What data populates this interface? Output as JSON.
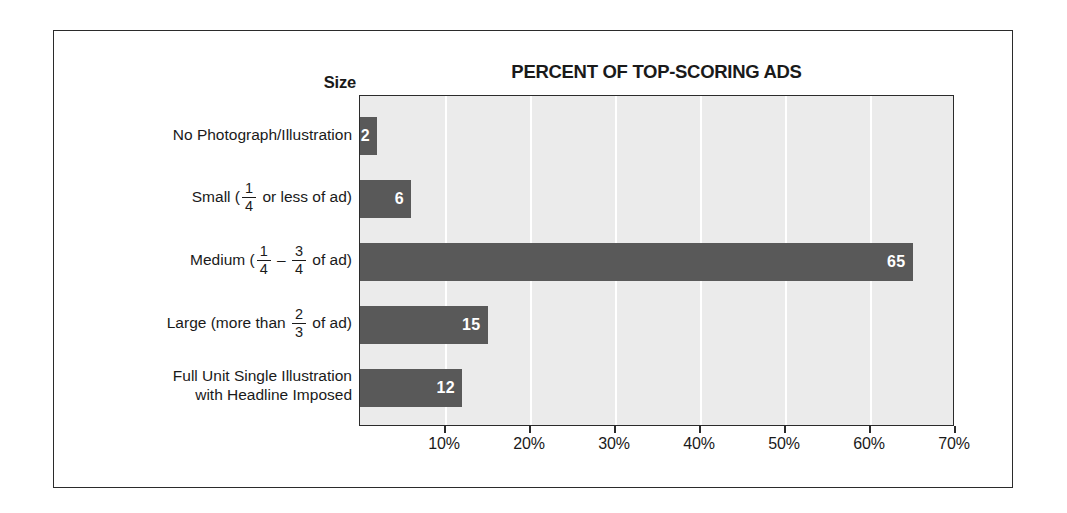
{
  "chart_data": {
    "type": "bar",
    "orientation": "horizontal",
    "title": "PERCENT OF TOP-SCORING ADS",
    "ylabel": "Size",
    "xlabel": "",
    "categories": [
      "No Photograph/Illustration",
      "Small ( 1/4 or less of ad)",
      "Medium ( 1/4 – 3/4 of ad)",
      "Large (more than 2/3 of ad)",
      "Full Unit Single Illustration with Headline Imposed"
    ],
    "values": [
      2,
      6,
      65,
      15,
      12
    ],
    "value_labels": [
      "2",
      "6",
      "65",
      "15",
      "12"
    ],
    "xlim": [
      0,
      70
    ],
    "xticks": [
      10,
      20,
      30,
      40,
      50,
      60,
      70
    ],
    "xtick_labels": [
      "10%",
      "20%",
      "30%",
      "40%",
      "50%",
      "60%",
      "70%"
    ],
    "grid": true,
    "legend": null,
    "bar_color": "#595959",
    "plot_background": "#ebebeb",
    "gridline_color": "#ffffff",
    "text_color": "#1a1a1a",
    "value_label_color": "#ffffff"
  },
  "categories_rich": [
    {
      "id": "no-photograph",
      "lines": [
        {
          "parts": [
            {
              "type": "text",
              "text": "No Photograph/Illustration"
            }
          ]
        }
      ]
    },
    {
      "id": "small",
      "lines": [
        {
          "parts": [
            {
              "type": "text",
              "text": "Small ("
            },
            {
              "type": "fraction",
              "numerator": "1",
              "denominator": "4"
            },
            {
              "type": "text",
              "text": " or less of ad)"
            }
          ]
        }
      ]
    },
    {
      "id": "medium",
      "lines": [
        {
          "parts": [
            {
              "type": "text",
              "text": "Medium ("
            },
            {
              "type": "fraction",
              "numerator": "1",
              "denominator": "4"
            },
            {
              "type": "text",
              "text": " – "
            },
            {
              "type": "fraction",
              "numerator": "3",
              "denominator": "4"
            },
            {
              "type": "text",
              "text": " of ad)"
            }
          ]
        }
      ]
    },
    {
      "id": "large",
      "lines": [
        {
          "parts": [
            {
              "type": "text",
              "text": "Large (more than "
            },
            {
              "type": "fraction",
              "numerator": "2",
              "denominator": "3"
            },
            {
              "type": "text",
              "text": " of ad)"
            }
          ]
        }
      ]
    },
    {
      "id": "full-unit",
      "lines": [
        {
          "parts": [
            {
              "type": "text",
              "text": "Full Unit Single Illustration"
            }
          ]
        },
        {
          "parts": [
            {
              "type": "text",
              "text": "with Headline Imposed"
            }
          ]
        }
      ]
    }
  ]
}
